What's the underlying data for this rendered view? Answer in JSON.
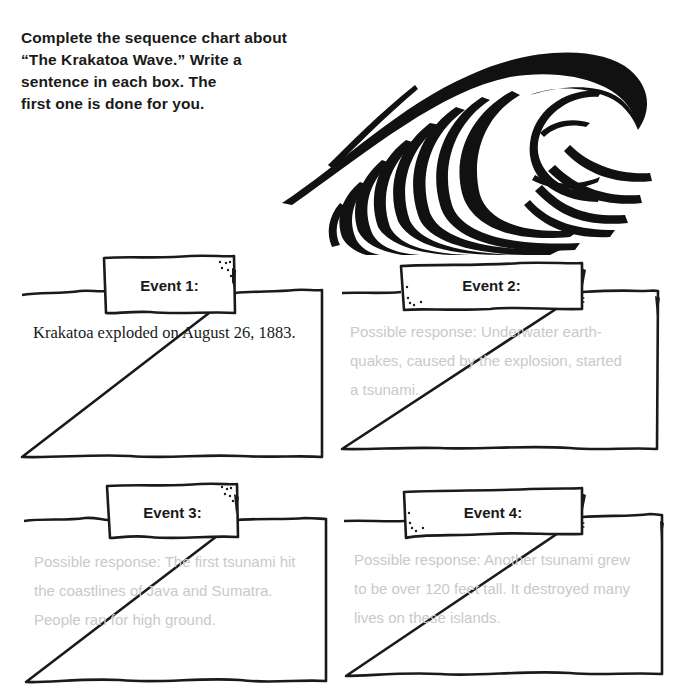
{
  "instructions": {
    "lines": [
      "Complete the sequence chart about",
      "“The Krakatoa Wave.” Write a",
      "sentence in each box. The",
      "first one is done for you."
    ]
  },
  "illustration": {
    "icon": "ocean-wave-icon"
  },
  "events": [
    {
      "label": "Event 1:",
      "lines": [
        "Krakatoa exploded on August 26, 1883."
      ],
      "style": "given"
    },
    {
      "label": "Event 2:",
      "lines": [
        "Possible response: Underwater earth-",
        "quakes, caused by the explosion, started",
        "a tsunami."
      ],
      "style": "response"
    },
    {
      "label": "Event 3:",
      "lines": [
        "Possible response: The first tsunami hit",
        "the coastlines of Java and Sumatra.",
        "People ran for high ground."
      ],
      "style": "response"
    },
    {
      "label": "Event 4:",
      "lines": [
        "Possible response: Another tsunami grew",
        "to be over 120 feet tall. It destroyed many",
        "lives on these islands."
      ],
      "style": "response"
    }
  ],
  "colors": {
    "ink": "#1a1a1a",
    "response_text": "#c9c9c9",
    "background": "#ffffff"
  }
}
